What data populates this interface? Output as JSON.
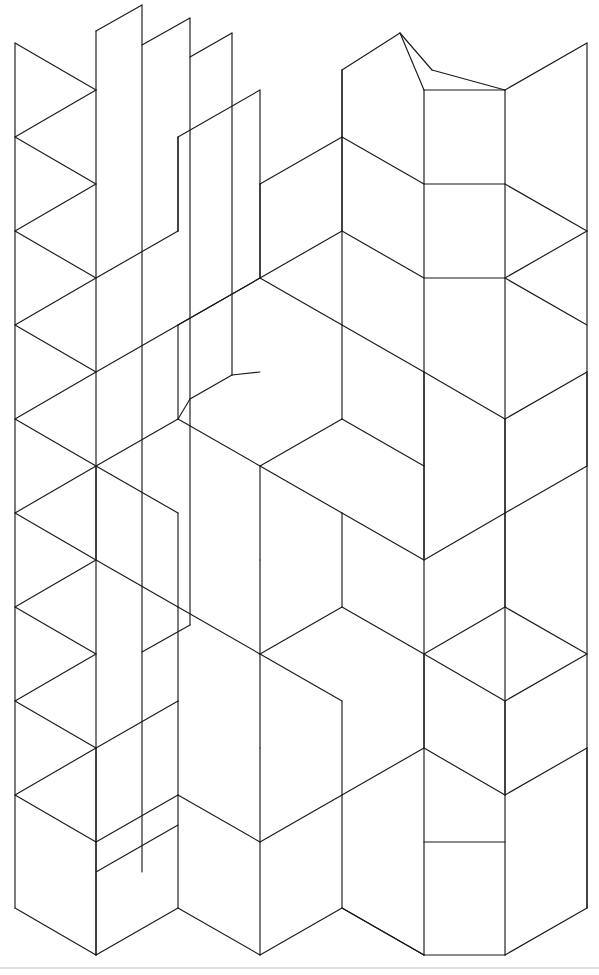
{
  "document": {
    "title": "Isometric Tiling Line Drawing",
    "canvas_width": 599,
    "canvas_height": 975,
    "background_color": "#ffffff",
    "stroke_color": "#1a1a1a",
    "stroke_width": 1.15,
    "style": "black-and-white axonometric line art, no text labels"
  },
  "chart_data": {
    "type": "diagram",
    "title": "",
    "subtitle": "",
    "xlabel": "",
    "ylabel": "",
    "legend": [],
    "annotations": [],
    "lattice": {
      "column_x": [
        15,
        96.8,
        178.6,
        260.4,
        342.2,
        424,
        505.8,
        587.6
      ],
      "row_pitch": 94,
      "half_row": 47,
      "columns_used": 8
    },
    "stroke_palette": {
      "line": "#1a1a1a",
      "paper": "#ffffff",
      "bottom_rule": "#d8d8d8"
    },
    "polylines": [
      [
        [
          15,
          43
        ],
        [
          15,
          908
        ]
      ],
      [
        [
          15,
          43
        ],
        [
          96,
          90
        ]
      ],
      [
        [
          15,
          137
        ],
        [
          96,
          90
        ]
      ],
      [
        [
          15,
          137
        ],
        [
          96,
          184
        ]
      ],
      [
        [
          15,
          231
        ],
        [
          96,
          184
        ]
      ],
      [
        [
          15,
          231
        ],
        [
          96,
          278
        ]
      ],
      [
        [
          15,
          325
        ],
        [
          96,
          278
        ]
      ],
      [
        [
          15,
          325
        ],
        [
          96,
          372
        ]
      ],
      [
        [
          15,
          419
        ],
        [
          96,
          372
        ]
      ],
      [
        [
          15,
          419
        ],
        [
          96,
          466
        ]
      ],
      [
        [
          15,
          513
        ],
        [
          96,
          466
        ]
      ],
      [
        [
          15,
          513
        ],
        [
          96,
          560
        ]
      ],
      [
        [
          15,
          607
        ],
        [
          96,
          560
        ]
      ],
      [
        [
          15,
          607
        ],
        [
          96,
          654
        ]
      ],
      [
        [
          15,
          701
        ],
        [
          96,
          654
        ]
      ],
      [
        [
          15,
          701
        ],
        [
          96,
          748
        ]
      ],
      [
        [
          15,
          795
        ],
        [
          96,
          748
        ]
      ],
      [
        [
          15,
          795
        ],
        [
          96,
          842
        ]
      ],
      [
        [
          15,
          908
        ],
        [
          96,
          955
        ]
      ],
      [
        [
          96,
          90
        ],
        [
          96,
          955
        ]
      ],
      [
        [
          142,
          5
        ],
        [
          142,
          872
        ]
      ],
      [
        [
          142,
          5
        ],
        [
          96,
          31
        ]
      ],
      [
        [
          96,
          872
        ],
        [
          178,
          825
        ]
      ],
      [
        [
          190,
          18
        ],
        [
          190,
          625
        ]
      ],
      [
        [
          190,
          18
        ],
        [
          142,
          45
        ]
      ],
      [
        [
          190,
          625
        ],
        [
          142,
          652
        ]
      ],
      [
        [
          232,
          33
        ],
        [
          232,
          375
        ]
      ],
      [
        [
          232,
          33
        ],
        [
          190,
          57
        ]
      ],
      [
        [
          232,
          375
        ],
        [
          190,
          399
        ]
      ],
      [
        [
          96,
          278
        ],
        [
          178,
          231
        ]
      ],
      [
        [
          178,
          231
        ],
        [
          178,
          137
        ]
      ],
      [
        [
          96,
          372
        ],
        [
          178,
          325
        ]
      ],
      [
        [
          178,
          325
        ],
        [
          260,
          278
        ]
      ],
      [
        [
          260,
          278
        ],
        [
          260,
          184
        ]
      ],
      [
        [
          178,
          325
        ],
        [
          178,
          419
        ]
      ],
      [
        [
          178,
          419
        ],
        [
          260,
          466
        ]
      ],
      [
        [
          260,
          466
        ],
        [
          342,
          419
        ]
      ],
      [
        [
          342,
          419
        ],
        [
          342,
          325
        ]
      ],
      [
        [
          342,
          325
        ],
        [
          260,
          278
        ]
      ],
      [
        [
          260,
          278
        ],
        [
          178,
          325
        ]
      ],
      [
        [
          178,
          419
        ],
        [
          96,
          466
        ]
      ],
      [
        [
          96,
          466
        ],
        [
          96,
          560
        ]
      ],
      [
        [
          96,
          560
        ],
        [
          178,
          607
        ]
      ],
      [
        [
          178,
          607
        ],
        [
          178,
          513
        ]
      ],
      [
        [
          178,
          513
        ],
        [
          96,
          466
        ]
      ],
      [
        [
          178,
          607
        ],
        [
          260,
          654
        ]
      ],
      [
        [
          260,
          654
        ],
        [
          342,
          607
        ]
      ],
      [
        [
          342,
          607
        ],
        [
          342,
          513
        ]
      ],
      [
        [
          342,
          513
        ],
        [
          260,
          466
        ]
      ],
      [
        [
          260,
          466
        ],
        [
          260,
          560
        ]
      ],
      [
        [
          260,
          560
        ],
        [
          260,
          654
        ]
      ],
      [
        [
          178,
          607
        ],
        [
          178,
          701
        ]
      ],
      [
        [
          178,
          701
        ],
        [
          96,
          748
        ]
      ],
      [
        [
          96,
          748
        ],
        [
          96,
          842
        ]
      ],
      [
        [
          96,
          842
        ],
        [
          178,
          795
        ]
      ],
      [
        [
          178,
          795
        ],
        [
          178,
          701
        ]
      ],
      [
        [
          178,
          795
        ],
        [
          260,
          842
        ]
      ],
      [
        [
          260,
          842
        ],
        [
          342,
          795
        ]
      ],
      [
        [
          342,
          795
        ],
        [
          342,
          701
        ]
      ],
      [
        [
          342,
          701
        ],
        [
          260,
          654
        ]
      ],
      [
        [
          260,
          654
        ],
        [
          260,
          748
        ]
      ],
      [
        [
          260,
          748
        ],
        [
          260,
          955
        ]
      ],
      [
        [
          96,
          955
        ],
        [
          178,
          908
        ]
      ],
      [
        [
          178,
          908
        ],
        [
          260,
          955
        ]
      ],
      [
        [
          260,
          955
        ],
        [
          342,
          908
        ]
      ],
      [
        [
          342,
          908
        ],
        [
          424,
          955
        ]
      ],
      [
        [
          178,
          795
        ],
        [
          178,
          908
        ]
      ],
      [
        [
          342,
          795
        ],
        [
          342,
          908
        ]
      ],
      [
        [
          96,
          842
        ],
        [
          96,
          955
        ]
      ],
      [
        [
          342,
          419
        ],
        [
          424,
          466
        ]
      ],
      [
        [
          424,
          466
        ],
        [
          424,
          372
        ]
      ],
      [
        [
          424,
          372
        ],
        [
          342,
          325
        ]
      ],
      [
        [
          342,
          513
        ],
        [
          424,
          560
        ]
      ],
      [
        [
          424,
          560
        ],
        [
          505,
          513
        ]
      ],
      [
        [
          505,
          513
        ],
        [
          505,
          419
        ]
      ],
      [
        [
          424,
          372
        ],
        [
          505,
          419
        ]
      ],
      [
        [
          424,
          466
        ],
        [
          424,
          560
        ]
      ],
      [
        [
          342,
          607
        ],
        [
          424,
          654
        ]
      ],
      [
        [
          424,
          654
        ],
        [
          424,
          748
        ]
      ],
      [
        [
          424,
          748
        ],
        [
          342,
          795
        ]
      ],
      [
        [
          424,
          654
        ],
        [
          505,
          607
        ]
      ],
      [
        [
          505,
          607
        ],
        [
          505,
          513
        ]
      ],
      [
        [
          424,
          748
        ],
        [
          505,
          795
        ]
      ],
      [
        [
          505,
          795
        ],
        [
          505,
          701
        ]
      ],
      [
        [
          505,
          701
        ],
        [
          424,
          654
        ]
      ],
      [
        [
          424,
          842
        ],
        [
          505,
          842
        ]
      ],
      [
        [
          424,
          955
        ],
        [
          505,
          955
        ]
      ],
      [
        [
          424,
          955
        ],
        [
          342,
          908
        ]
      ],
      [
        [
          505,
          955
        ],
        [
          587,
          908
        ]
      ],
      [
        [
          424,
          372
        ],
        [
          424,
          955
        ]
      ],
      [
        [
          505,
          419
        ],
        [
          505,
          955
        ]
      ],
      [
        [
          424,
          90
        ],
        [
          505,
          90
        ]
      ],
      [
        [
          424,
          184
        ],
        [
          505,
          184
        ]
      ],
      [
        [
          424,
          278
        ],
        [
          505,
          278
        ]
      ],
      [
        [
          424,
          90
        ],
        [
          424,
          372
        ]
      ],
      [
        [
          505,
          90
        ],
        [
          505,
          419
        ]
      ],
      [
        [
          400,
          33
        ],
        [
          424,
          90
        ]
      ],
      [
        [
          400,
          33
        ],
        [
          342,
          70
        ]
      ],
      [
        [
          505,
          90
        ],
        [
          587,
          43
        ]
      ],
      [
        [
          587,
          43
        ],
        [
          587,
          908
        ]
      ],
      [
        [
          505,
          184
        ],
        [
          587,
          231
        ]
      ],
      [
        [
          587,
          231
        ],
        [
          505,
          278
        ]
      ],
      [
        [
          505,
          278
        ],
        [
          587,
          325
        ]
      ],
      [
        [
          505,
          419
        ],
        [
          587,
          372
        ]
      ],
      [
        [
          587,
          372
        ],
        [
          587,
          466
        ]
      ],
      [
        [
          505,
          513
        ],
        [
          587,
          466
        ]
      ],
      [
        [
          505,
          607
        ],
        [
          587,
          654
        ]
      ],
      [
        [
          587,
          654
        ],
        [
          505,
          701
        ]
      ],
      [
        [
          505,
          795
        ],
        [
          587,
          748
        ]
      ],
      [
        [
          587,
          748
        ],
        [
          587,
          908
        ]
      ],
      [
        [
          342,
          70
        ],
        [
          342,
          325
        ]
      ],
      [
        [
          232,
          375
        ],
        [
          260,
          372
        ]
      ],
      [
        [
          190,
          399
        ],
        [
          178,
          419
        ]
      ],
      [
        [
          96,
          31
        ],
        [
          96,
          90
        ]
      ],
      [
        [
          260,
          184
        ],
        [
          342,
          137
        ]
      ],
      [
        [
          342,
          137
        ],
        [
          342,
          70
        ]
      ],
      [
        [
          260,
          184
        ],
        [
          260,
          278
        ]
      ],
      [
        [
          178,
          137
        ],
        [
          260,
          90
        ]
      ],
      [
        [
          260,
          90
        ],
        [
          260,
          184
        ]
      ],
      [
        [
          342,
          137
        ],
        [
          424,
          184
        ]
      ],
      [
        [
          342,
          231
        ],
        [
          424,
          278
        ]
      ],
      [
        [
          342,
          231
        ],
        [
          342,
          137
        ]
      ],
      [
        [
          342,
          231
        ],
        [
          260,
          278
        ]
      ],
      [
        [
          178,
          137
        ],
        [
          178,
          231
        ]
      ],
      [
        [
          432,
          70
        ],
        [
          505,
          90
        ]
      ],
      [
        [
          432,
          70
        ],
        [
          400,
          33
        ]
      ]
    ]
  },
  "figure": {
    "name": "axonometric-tiling",
    "caption": ""
  }
}
